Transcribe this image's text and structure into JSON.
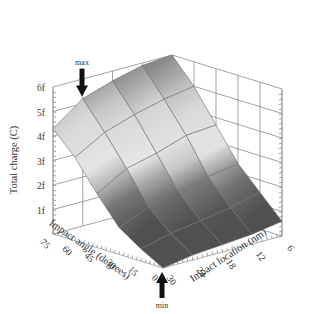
{
  "chart_data": {
    "type": "surface3d",
    "title": "",
    "zlabel": "Total charge (C)",
    "xlabel": "Impact angle (degrees)",
    "ylabel": "Impact location (nm)",
    "x_ticks": [
      "75",
      "60",
      "45",
      "30",
      "15",
      "0"
    ],
    "y_ticks": [
      "30",
      "24",
      "18",
      "12",
      "6"
    ],
    "z_ticks": [
      "1f",
      "2f",
      "3f",
      "4f",
      "5f",
      "6f"
    ],
    "angle_values": [
      75,
      60,
      45,
      30,
      15,
      0
    ],
    "location_values": [
      30,
      24,
      18,
      12,
      6
    ],
    "zlim": [
      0,
      6
    ],
    "z_unit": "fC",
    "surface_z": [
      [
        4.3,
        5.2,
        5.6,
        5.9,
        6.0
      ],
      [
        3.4,
        4.1,
        4.5,
        4.8,
        5.0
      ],
      [
        2.2,
        2.9,
        3.2,
        3.6,
        3.7
      ],
      [
        1.1,
        1.6,
        1.9,
        2.2,
        2.4
      ],
      [
        0.5,
        0.8,
        1.0,
        1.2,
        1.5
      ],
      [
        0.0,
        0.2,
        0.3,
        0.4,
        0.6
      ]
    ],
    "annotations": [
      {
        "text": "max",
        "at": {
          "angle": 75,
          "location": 24
        }
      },
      {
        "text": "min",
        "at": {
          "angle": 0,
          "location": 30
        }
      }
    ],
    "grid": true,
    "colormap": "grayscale"
  }
}
